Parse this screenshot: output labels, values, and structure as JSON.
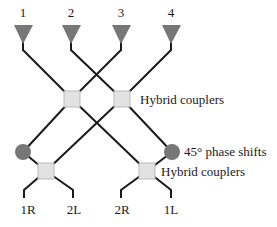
{
  "diagram": {
    "inputs": [
      {
        "label": "1",
        "x": 23
      },
      {
        "label": "2",
        "x": 71
      },
      {
        "label": "3",
        "x": 121
      },
      {
        "label": "4",
        "x": 171
      }
    ],
    "outputs": [
      {
        "label": "1R",
        "x": 28
      },
      {
        "label": "2L",
        "x": 74
      },
      {
        "label": "2R",
        "x": 122
      },
      {
        "label": "1L",
        "x": 171
      }
    ],
    "annotations": {
      "top_couplers": "Hybrid couplers",
      "phase_shifts": "45° phase shifts",
      "bottom_couplers": "Hybrid couplers"
    },
    "colors": {
      "wire": "#1a1a1a",
      "triangle": "#777777",
      "coupler_fill": "#e2e2e2",
      "phase_shift_fill": "#777777"
    }
  }
}
